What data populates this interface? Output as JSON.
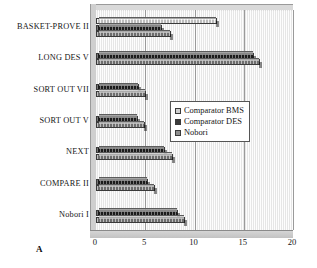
{
  "panel_label": "A",
  "legend": {
    "position": "center-right-inside",
    "entries": [
      {
        "label": "Comparator BMS",
        "color": "#d0d0d0",
        "key": "bms"
      },
      {
        "label": "Comparator DES",
        "color": "#3b3b3b",
        "key": "des"
      },
      {
        "label": "Nobori",
        "color": "#8e8e8e",
        "key": "nob"
      }
    ]
  },
  "chart_data": {
    "type": "bar",
    "orientation": "horizontal",
    "title": "",
    "subtitle": "",
    "xlabel": "",
    "ylabel": "",
    "xlim": [
      0,
      20
    ],
    "xticks": [
      0,
      5,
      10,
      15,
      20
    ],
    "xtick_labels": [
      "0",
      "5",
      "10",
      "15",
      "20"
    ],
    "grid": true,
    "grid_axis": "x",
    "legend_position": "center-right-inside",
    "categories": [
      "BASKET-PROVE II",
      "LONG DES V",
      "SORT OUT VII",
      "SORT OUT V",
      "NEXT",
      "COMPARE II",
      "Nobori I"
    ],
    "series": [
      {
        "name": "Comparator BMS",
        "color": "#d0d0d0",
        "values": [
          12.3,
          null,
          null,
          null,
          null,
          null,
          null
        ]
      },
      {
        "name": "Comparator DES",
        "color": "#3b3b3b",
        "values": [
          6.7,
          16.0,
          4.4,
          4.3,
          7.0,
          5.3,
          8.3
        ]
      },
      {
        "name": "Nobori",
        "color": "#8e8e8e",
        "values": [
          7.6,
          16.6,
          5.1,
          5.0,
          7.8,
          6.0,
          9.0
        ]
      }
    ]
  }
}
